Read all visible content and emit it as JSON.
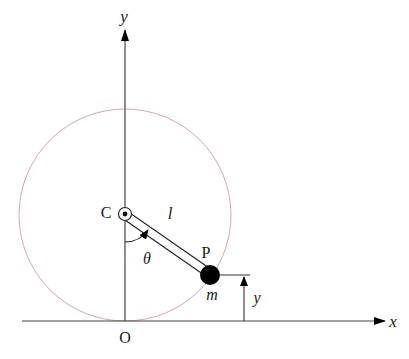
{
  "diagram": {
    "type": "pendulum-on-circle",
    "colors": {
      "stroke": "#333333",
      "circle": "#d4a8ae",
      "mass": "#000000",
      "background": "#ffffff"
    },
    "axes": {
      "x_label": "x",
      "y_label": "y",
      "origin_label": "O"
    },
    "pivot": {
      "label": "C"
    },
    "rod": {
      "length_label": "l"
    },
    "angle": {
      "label": "θ"
    },
    "bob": {
      "point_label": "P",
      "mass_label": "m"
    },
    "height": {
      "label": "y"
    }
  }
}
